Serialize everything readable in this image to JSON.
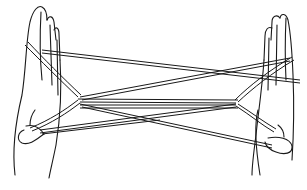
{
  "illustration": {
    "subject": "string figure between two hands (cat's cradle)",
    "colors": {
      "ink": "#1a1a1a",
      "background": "#ffffff"
    }
  }
}
